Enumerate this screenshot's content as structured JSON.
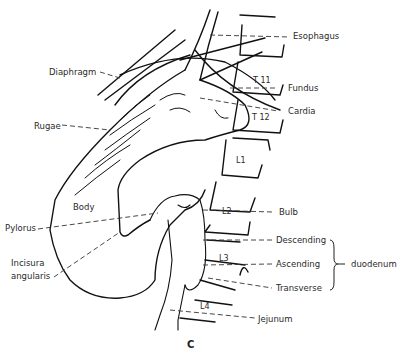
{
  "figure": {
    "caption": "C",
    "labels_left": {
      "diaphragm": "Diaphragm",
      "rugae": "Rugae",
      "body": "Body",
      "pylorus": "Pylorus",
      "incisura_1": "Incisura",
      "incisura_2": "angularis"
    },
    "labels_right": {
      "esophagus": "Esophagus",
      "fundus": "Fundus",
      "cardia": "Cardia",
      "bulb": "Bulb",
      "descending": "Descending",
      "ascending": "Ascending",
      "transverse": "Transverse",
      "jejunum": "Jejunum",
      "duodenum": "duodenum"
    },
    "vertebrae": {
      "t11": "T 11",
      "t12": "T 12",
      "l1": "L1",
      "l2": "L2",
      "l3": "L3",
      "l4": "L4"
    }
  }
}
